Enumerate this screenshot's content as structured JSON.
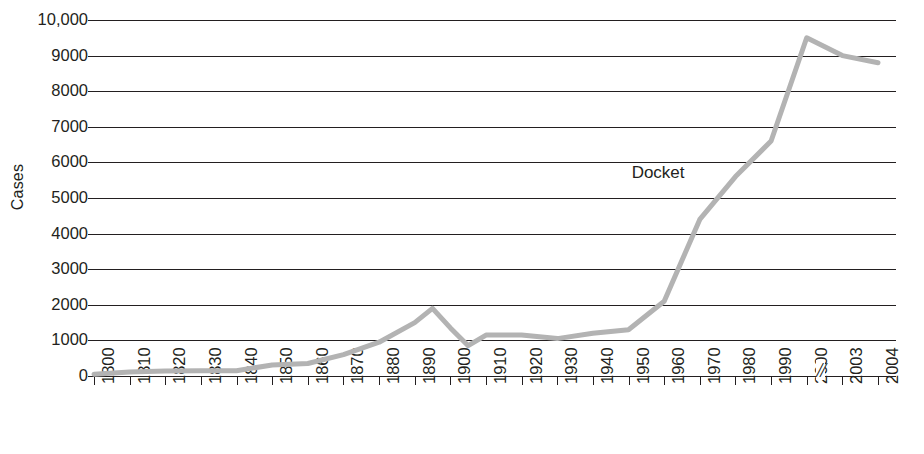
{
  "chart_data": {
    "type": "line",
    "title": "",
    "subtitle": "",
    "xlabel": "",
    "ylabel": "Cases",
    "grid": true,
    "legend_position": "inline-annotation",
    "ylim": [
      0,
      10000
    ],
    "y_ticks": [
      0,
      1000,
      2000,
      3000,
      4000,
      5000,
      6000,
      7000,
      8000,
      9000,
      10000
    ],
    "y_tick_labels": [
      "0",
      "1000",
      "2000",
      "3000",
      "4000",
      "5000",
      "6000",
      "7000",
      "8000",
      "9000",
      "10,000"
    ],
    "x_ticks": [
      "1800",
      "1810",
      "1820",
      "1830",
      "1840",
      "1850",
      "1860",
      "1870",
      "1880",
      "1890",
      "1900",
      "1910",
      "1920",
      "1930",
      "1940",
      "1950",
      "1960",
      "1970",
      "1980",
      "1990",
      "2000",
      "2003",
      "2004"
    ],
    "x_axis_break": {
      "symbol": "//",
      "between": [
        "2000",
        "2003"
      ]
    },
    "annotations": [
      {
        "text": "Docket",
        "x": "1975",
        "y": 5700
      }
    ],
    "series": [
      {
        "name": "Docket",
        "color": "#b3b3b3",
        "x": [
          "1800",
          "1810",
          "1820",
          "1830",
          "1840",
          "1850",
          "1860",
          "1870",
          "1880",
          "1890",
          "1895",
          "1900",
          "1905",
          "1910",
          "1920",
          "1930",
          "1940",
          "1950",
          "1960",
          "1970",
          "1980",
          "1990",
          "2000",
          "2003",
          "2004"
        ],
        "values": [
          50,
          110,
          140,
          150,
          150,
          310,
          350,
          600,
          950,
          1500,
          1900,
          1350,
          850,
          1150,
          1150,
          1050,
          1200,
          1300,
          2100,
          4400,
          5600,
          6600,
          9500,
          9000,
          8800
        ]
      }
    ]
  },
  "axis": {
    "y_title": "Cases"
  }
}
